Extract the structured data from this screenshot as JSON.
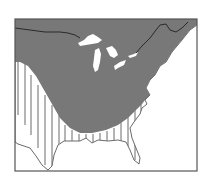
{
  "map": {
    "type": "species-range-map",
    "region": "eastern-north-america",
    "colors": {
      "background": "#ffffff",
      "range_fill": "#787878",
      "frame": "#555555",
      "outline": "#444444",
      "lakes": "#ffffff",
      "stripes": "#6a6a6a",
      "border_line": "#2a2a2a"
    },
    "legend_regions": [
      {
        "name": "solid-range",
        "pattern": "solid gray"
      },
      {
        "name": "striped-range",
        "pattern": "vertical stripes"
      }
    ]
  }
}
